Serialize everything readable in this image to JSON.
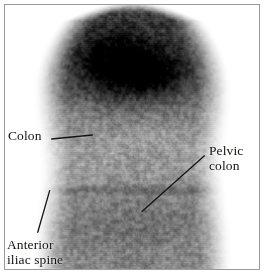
{
  "figure": {
    "type": "scintigram",
    "modality": "nuclear-medicine-scan",
    "orientation": "anterior-abdomen-pelvis",
    "frame_color": "#9a9a9a",
    "background_color": "#ffffff",
    "ink_color": "#16120f"
  },
  "annotations": [
    {
      "id": "colon",
      "text": "Colon",
      "lines": [
        "Colon"
      ],
      "position": "left",
      "leader": {
        "x1": 47,
        "y1": 135,
        "x2": 88,
        "y2": 131
      }
    },
    {
      "id": "pelvic-colon",
      "text": "Pelvic colon",
      "lines": [
        "Pelvic",
        "colon"
      ],
      "position": "right",
      "leader": {
        "x1": 201,
        "y1": 152,
        "x2": 138,
        "y2": 208
      }
    },
    {
      "id": "anterior-iliac-spine",
      "text": "Anterior iliac spine",
      "lines": [
        "Anterior",
        "iliac spine"
      ],
      "position": "bottom-left",
      "leader": {
        "x1": 45,
        "y1": 187,
        "x2": 33,
        "y2": 229
      }
    }
  ],
  "scan": {
    "description": "Grayscale radionuclide uptake image of abdomen and pelvis",
    "hot_spot": {
      "label": "transverse-colon-uptake",
      "cx": 115,
      "cy": 62,
      "rx": 58,
      "ry": 40
    },
    "body_bounds": {
      "left": 34,
      "right": 222,
      "top": 6,
      "bottom": 266
    },
    "pelvic_band": {
      "y": 186,
      "height": 4
    }
  }
}
